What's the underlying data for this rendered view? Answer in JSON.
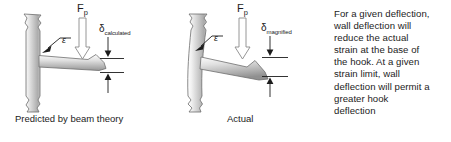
{
  "figure": {
    "title_region": "beam-deflection-comparison",
    "background_color": "#ffffff",
    "ink_color": "#1c1c1c",
    "panels": [
      {
        "id": "predicted",
        "caption": "Predicted by beam theory",
        "force_symbol": "F",
        "force_subscript": "p",
        "deflection_symbol": "δ",
        "deflection_subscript": "calculated",
        "strain_symbol": "ε",
        "wall_state": "straight",
        "hook_state": "bent-downward-slightly"
      },
      {
        "id": "actual",
        "caption": "Actual",
        "force_symbol": "F",
        "force_subscript": "p",
        "deflection_symbol": "δ",
        "deflection_subscript": "magnified",
        "strain_symbol": "ε",
        "wall_state": "curved",
        "hook_state": "bent-downward-strongly"
      }
    ],
    "note": {
      "lines": [
        "For a given deflection,",
        "wall deflection will",
        "reduce the actual",
        "strain at the base of",
        "the hook.  At a given",
        "strain limit, wall",
        "deflection will permit a",
        "greater hook",
        "deflection"
      ],
      "text": "For a given deflection, wall deflection will reduce the actual strain at the base of the hook.  At a given strain limit, wall deflection will permit a greater hook deflection"
    }
  }
}
